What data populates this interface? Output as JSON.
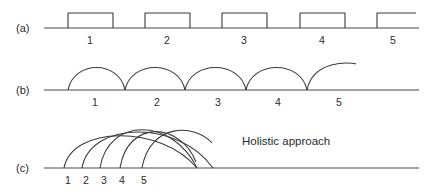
{
  "figure": {
    "background": "#ffffff",
    "line_color": "#3a3a3a",
    "axis_color": "#4a4a4a",
    "rows": [
      {
        "label": "(a)",
        "label_x": 16,
        "label_y": 32,
        "style": "rectangular-pulses",
        "baseline_y": 28,
        "axis_x1": 44,
        "axis_x2": 419,
        "tick_y": 44,
        "ticks": [
          {
            "text": "1",
            "x": 90
          },
          {
            "text": "2",
            "x": 167
          },
          {
            "text": "3",
            "x": 244
          },
          {
            "text": "4",
            "x": 322
          },
          {
            "text": "5",
            "x": 393
          }
        ],
        "pulses": [
          {
            "x1": 68,
            "x2": 113,
            "top_y": 13,
            "closed": true
          },
          {
            "x1": 145,
            "x2": 190,
            "top_y": 13,
            "closed": true
          },
          {
            "x1": 222,
            "x2": 267,
            "top_y": 13,
            "closed": true
          },
          {
            "x1": 300,
            "x2": 345,
            "top_y": 13,
            "closed": true
          },
          {
            "x1": 377,
            "x2": 416,
            "top_y": 13,
            "closed": false
          }
        ]
      },
      {
        "label": "(b)",
        "label_x": 16,
        "label_y": 94,
        "style": "touching-arcs",
        "baseline_y": 90,
        "axis_x1": 44,
        "axis_x2": 419,
        "tick_y": 106,
        "ticks": [
          {
            "text": "1",
            "x": 95
          },
          {
            "text": "2",
            "x": 157
          },
          {
            "text": "3",
            "x": 218
          },
          {
            "text": "4",
            "x": 278
          },
          {
            "text": "5",
            "x": 339
          }
        ],
        "arcs": [
          {
            "x1": 68,
            "x2": 125,
            "peak_y": 64,
            "clipped": false
          },
          {
            "x1": 125,
            "x2": 185,
            "peak_y": 64,
            "clipped": false
          },
          {
            "x1": 185,
            "x2": 246,
            "peak_y": 64,
            "clipped": false
          },
          {
            "x1": 246,
            "x2": 307,
            "peak_y": 64,
            "clipped": false
          },
          {
            "x1": 307,
            "x2": 368,
            "peak_y": 64,
            "clipped": true,
            "clip_x": 356
          }
        ]
      },
      {
        "label": "(c)",
        "label_x": 16,
        "label_y": 172,
        "style": "overlapping-wide-arcs",
        "baseline_y": 168,
        "axis_x1": 44,
        "axis_x2": 419,
        "tick_y": 184,
        "ticks": [
          {
            "text": "1",
            "x": 68
          },
          {
            "text": "2",
            "x": 86
          },
          {
            "text": "3",
            "x": 104
          },
          {
            "text": "4",
            "x": 122
          },
          {
            "text": "5",
            "x": 144
          }
        ],
        "arcs": [
          {
            "x1": 64,
            "x2": 197,
            "peak_y": 133,
            "clipped": false
          },
          {
            "x1": 82,
            "x2": 213,
            "peak_y": 128,
            "clipped": false
          },
          {
            "x1": 100,
            "x2": 197,
            "peak_y": 124,
            "clipped": false
          },
          {
            "x1": 120,
            "x2": 207,
            "peak_y": 126,
            "clipped": true,
            "clip_x": 196
          },
          {
            "x1": 142,
            "x2": 226,
            "peak_y": 129,
            "clipped": true,
            "clip_x": 212
          }
        ],
        "annotation": {
          "text": "Holistic approach",
          "x": 242,
          "y": 145
        }
      }
    ]
  }
}
